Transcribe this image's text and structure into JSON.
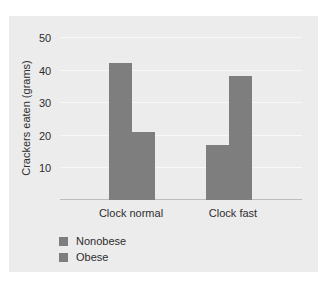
{
  "chart_data": {
    "type": "bar",
    "title": "",
    "xlabel": "",
    "ylabel": "Crackers eaten (grams)",
    "ylim": [
      0,
      50
    ],
    "yticks": [
      10,
      20,
      30,
      40,
      50
    ],
    "grid": true,
    "legend_position": "bottom-left",
    "categories": [
      "Clock normal",
      "Clock fast"
    ],
    "series": [
      {
        "name": "Nonobese",
        "values": [
          42,
          17
        ],
        "color": "#7e7e7e"
      },
      {
        "name": "Obese",
        "values": [
          21,
          38
        ],
        "color": "#7e7e7e"
      }
    ]
  },
  "axis": {
    "ylabel": "Crackers eaten (grams)",
    "ticks": [
      "10",
      "20",
      "30",
      "40",
      "50"
    ]
  },
  "categories": [
    "Clock normal",
    "Clock fast"
  ],
  "legend": [
    "Nonobese",
    "Obese"
  ]
}
